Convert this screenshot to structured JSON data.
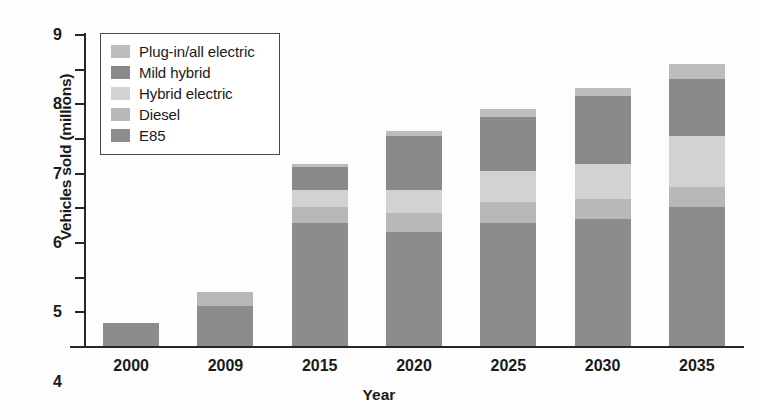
{
  "chart_data": {
    "type": "bar",
    "subtype": "stacked-bar",
    "title": "",
    "xlabel": "Year",
    "ylabel": "Vehicles sold (millions)",
    "categories": [
      "2000",
      "2009",
      "2015",
      "2020",
      "2025",
      "2030",
      "2035"
    ],
    "ylim": [
      0,
      9
    ],
    "yticks": [
      0,
      1,
      2,
      3,
      4,
      5,
      6,
      7,
      8,
      9
    ],
    "ytick_labels": [
      "0",
      "1",
      "2",
      "3",
      "4",
      "5",
      "6",
      "7",
      "8",
      "9"
    ],
    "grid": false,
    "legend_position": "upper-left-inside",
    "stack_order_bottom_to_top": [
      "E85",
      "Diesel",
      "Hybrid electric",
      "Mild hybrid",
      "Plug-in/all electric"
    ],
    "series": [
      {
        "name": "E85",
        "color": "#8c8c8c",
        "values": [
          0.65,
          1.15,
          3.55,
          3.3,
          3.55,
          3.65,
          4.0
        ]
      },
      {
        "name": "Diesel",
        "color": "#b8b8b8",
        "values": [
          0.0,
          0.4,
          0.45,
          0.55,
          0.6,
          0.6,
          0.6
        ]
      },
      {
        "name": "Hybrid electric",
        "color": "#d2d2d2",
        "values": [
          0.0,
          0.0,
          0.5,
          0.65,
          0.9,
          1.0,
          1.45
        ]
      },
      {
        "name": "Mild hybrid",
        "color": "#8a8a8a",
        "values": [
          0.0,
          0.0,
          0.65,
          1.55,
          1.55,
          1.95,
          1.65
        ]
      },
      {
        "name": "Plug-in/all electric",
        "color": "#bdbdbd",
        "values": [
          0.0,
          0.0,
          0.1,
          0.15,
          0.25,
          0.25,
          0.45
        ]
      }
    ],
    "totals": [
      0.65,
      1.55,
      5.25,
      6.2,
      6.85,
      7.45,
      8.15
    ]
  },
  "legend": {
    "items": [
      {
        "label": "Plug-in/all electric",
        "color": "#bdbdbd"
      },
      {
        "label": "Mild hybrid",
        "color": "#8a8a8a"
      },
      {
        "label": "Hybrid electric",
        "color": "#d2d2d2"
      },
      {
        "label": "Diesel",
        "color": "#b8b8b8"
      },
      {
        "label": "E85",
        "color": "#8c8c8c"
      }
    ]
  },
  "axes": {
    "x_title": "Year",
    "y_title": "Vehicles sold (millions)"
  }
}
